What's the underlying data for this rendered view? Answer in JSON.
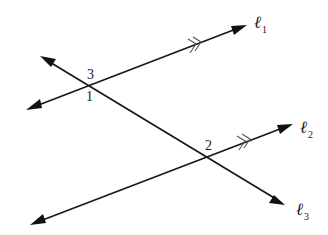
{
  "diagram": {
    "type": "parallel lines cut by a transversal",
    "colors": {
      "line": "#1a1a1a",
      "parallel_mark": "#555555",
      "background": "#ffffff"
    },
    "lines": [
      {
        "id": "l1",
        "label_main": "ℓ",
        "label_sub": "1",
        "role": "parallel line",
        "parallel_mark": ">>"
      },
      {
        "id": "l2",
        "label_main": "ℓ",
        "label_sub": "2",
        "role": "parallel line",
        "parallel_mark": ">>"
      },
      {
        "id": "l3",
        "label_main": "ℓ",
        "label_sub": "3",
        "role": "transversal"
      }
    ],
    "angle_labels": [
      {
        "id": "angle-3",
        "text": "3",
        "at": "intersection of l1 and l3, above"
      },
      {
        "id": "angle-1",
        "text": "1",
        "at": "intersection of l1 and l3, below"
      },
      {
        "id": "angle-2",
        "text": "2",
        "at": "intersection of l2 and l3, above"
      }
    ]
  }
}
